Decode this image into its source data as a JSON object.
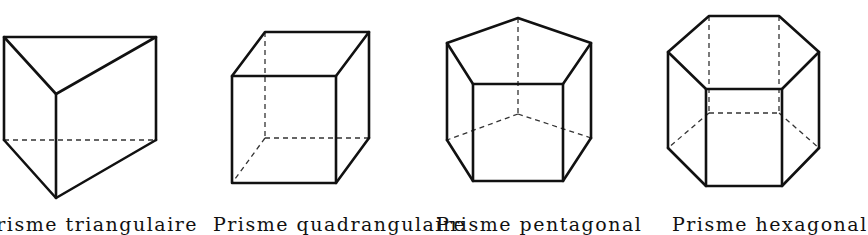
{
  "figure": {
    "edge_color": "#111111",
    "hidden_edge_style": "dashed"
  },
  "prisms": [
    {
      "name": "triangular-prism",
      "label": "Prisme triangulaire",
      "base_sides": 3
    },
    {
      "name": "quadrangular-prism",
      "label": "Prisme quadrangulaire",
      "base_sides": 4
    },
    {
      "name": "pentagonal-prism",
      "label": "Prisme pentagonal",
      "base_sides": 5
    },
    {
      "name": "hexagonal-prism",
      "label": "Prisme hexagonal",
      "base_sides": 6
    }
  ]
}
